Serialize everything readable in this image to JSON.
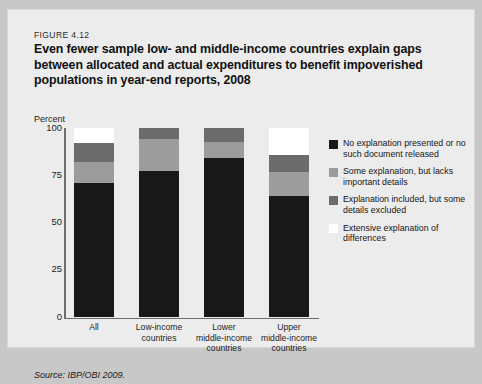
{
  "figure": {
    "number": "FIGURE 4.12",
    "title": "Even fewer sample low- and middle-income countries explain gaps between allocated and actual expenditures to benefit impoverished populations in year-end reports, 2008",
    "source": "Source: IBP/OBI 2009."
  },
  "chart_data": {
    "type": "bar",
    "stacked": true,
    "title": "Even fewer sample low- and middle-income countries explain gaps between allocated and actual expenditures to benefit impoverished populations in year-end reports, 2008",
    "xlabel": "",
    "ylabel": "Percent",
    "ylim": [
      0,
      100
    ],
    "yticks": [
      0,
      25,
      50,
      75,
      100
    ],
    "grid": false,
    "legend_position": "right",
    "categories": [
      "All",
      "Low-income countries",
      "Lower middle-income countries",
      "Upper middle-income countries"
    ],
    "category_labels": [
      [
        "All"
      ],
      [
        "Low-income",
        "countries"
      ],
      [
        "Lower",
        "middle-income",
        "countries"
      ],
      [
        "Upper",
        "middle-income",
        "countries"
      ]
    ],
    "series": [
      {
        "name": "No explanation presented or no such document released",
        "color": "#181818",
        "values": [
          71,
          77,
          84,
          64
        ]
      },
      {
        "name": "Some explanation, but lacks important details",
        "color": "#9c9c9c",
        "values": [
          11,
          17,
          8.5,
          12.5
        ]
      },
      {
        "name": "Explanation included, but some details excluded",
        "color": "#6b6b6b",
        "values": [
          10,
          6,
          7.5,
          9
        ]
      },
      {
        "name": "Extensive explanation of differences",
        "color": "#ffffff",
        "values": [
          8,
          0,
          0,
          14.5
        ]
      }
    ]
  },
  "legend": {
    "items": [
      {
        "label": "No explanation presented or no such document released",
        "color": "#181818"
      },
      {
        "label": "Some explanation, but lacks important details",
        "color": "#9c9c9c"
      },
      {
        "label": "Explanation included, but some details excluded",
        "color": "#6b6b6b"
      },
      {
        "label": "Extensive explanation of differences",
        "color": "#ffffff"
      }
    ]
  }
}
